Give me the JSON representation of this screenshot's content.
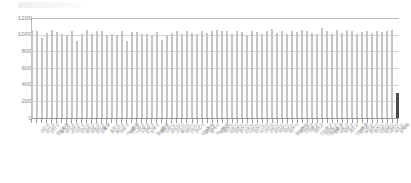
{
  "chart_data": {
    "type": "bar",
    "title": "",
    "subtitle": "",
    "xlabel": "",
    "ylabel": "",
    "ylim": [
      0,
      1200
    ],
    "ytick_values": [
      1200,
      1000,
      800,
      600,
      400,
      200,
      0
    ],
    "ytick_labels": [
      "1200",
      "1000",
      "800",
      "600",
      "400",
      "200",
      "0"
    ],
    "grid": true,
    "grid_axis": "y",
    "legend": null,
    "legend_position": "none",
    "bar_color": "#c4c4c4",
    "accent_color": "#4a4a4a",
    "note": "x tick labels are short rotated CJK (Korean) strings, rendered ~4px tall and illegible at source resolution; reproduced as placeholder glyph groups of matching length",
    "categories": [
      "구로구",
      "강서구",
      "양천구",
      "영등포구",
      "동작구",
      "관악구",
      "금천구",
      "서초구",
      "강남구",
      "송파구",
      "강동구",
      "광진구",
      "성동구",
      "중구",
      "종로구",
      "용산구",
      "마포구",
      "서대문구",
      "은평구",
      "노원구",
      "도봉구",
      "강북구",
      "성북구",
      "동대문구",
      "중랑구",
      "수원시",
      "성남시",
      "고양시",
      "용인시",
      "부천시",
      "안산시",
      "안양시",
      "남양주시",
      "화성시",
      "평택시",
      "의정부시",
      "시흥시",
      "파주시",
      "김포시",
      "광명시",
      "광주시",
      "군포시",
      "이천시",
      "양주시",
      "오산시",
      "구리시",
      "안성시",
      "포천시",
      "의왕시",
      "하남시",
      "여주시",
      "동두천시",
      "과천시",
      "양평군",
      "가평군",
      "연천군",
      "인천중구",
      "인천동구",
      "미추홀구",
      "연수구",
      "남동구",
      "부평구",
      "계양구",
      "인천서구",
      "강화군",
      "옹진군",
      "춘천시",
      "원주시",
      "강릉시",
      "동해시",
      "태백시",
      "속초시",
      "삼척시",
      "기타"
    ],
    "values": [
      1055,
      1040,
      955,
      1018,
      1062,
      1035,
      1005,
      1002,
      1048,
      930,
      1006,
      1052,
      1008,
      1040,
      1044,
      1000,
      1010,
      998,
      1046,
      930,
      1030,
      1038,
      1004,
      1012,
      1000,
      1036,
      940,
      1002,
      1020,
      1046,
      1014,
      1050,
      1026,
      1008,
      1040,
      1022,
      1045,
      1052,
      1044,
      1050,
      1008,
      1042,
      1038,
      1000,
      1046,
      1030,
      1010,
      1040,
      1065,
      1018,
      1050,
      1004,
      1044,
      1035,
      1060,
      1048,
      1020,
      1014,
      1075,
      1042,
      1006,
      1052,
      1016,
      1060,
      1044,
      1010,
      1036,
      1050,
      1022,
      1040,
      1030,
      1046,
      1058,
      300
    ],
    "accent_index": 73
  }
}
